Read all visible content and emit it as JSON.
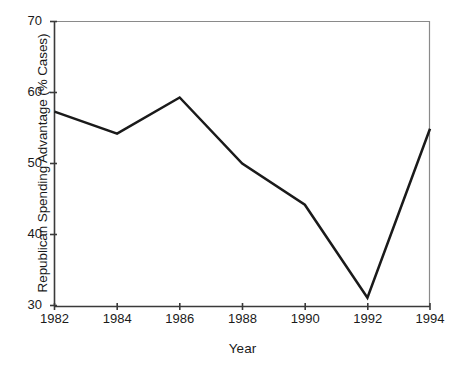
{
  "chart_data": {
    "type": "line",
    "title": "",
    "xlabel": "Year",
    "ylabel": "Republican Spending Advantage (% Cases)",
    "x": [
      1982,
      1984,
      1986,
      1988,
      1990,
      1992,
      1994
    ],
    "categories": [
      "1982",
      "1984",
      "1986",
      "1988",
      "1990",
      "1992",
      "1994"
    ],
    "values": [
      57.3,
      54.2,
      59.3,
      50.0,
      44.2,
      31.1,
      54.9
    ],
    "series": [
      {
        "name": "Republican Spending Advantage",
        "values": [
          57.3,
          54.2,
          59.3,
          50.0,
          44.2,
          31.1,
          54.9
        ]
      }
    ],
    "xlim": [
      1982,
      1994
    ],
    "ylim": [
      30,
      70
    ],
    "xticks": [
      "1982",
      "1984",
      "1986",
      "1988",
      "1990",
      "1992",
      "1994"
    ],
    "yticks": [
      "30",
      "40",
      "50",
      "60",
      "70"
    ],
    "grid": false,
    "legend": "none",
    "line_color": "#1a1a1a",
    "line_width": 2.5,
    "markers": "none",
    "background_color": "#ffffff",
    "axis_color": "#3a3a3a"
  },
  "axes": {
    "y_title": "Republican Spending Advantage (% Cases)",
    "x_title": "Year",
    "y_ticks": [
      {
        "label": "70",
        "value": 70
      },
      {
        "label": "60",
        "value": 60
      },
      {
        "label": "50",
        "value": 50
      },
      {
        "label": "40",
        "value": 40
      },
      {
        "label": "30",
        "value": 30
      }
    ],
    "x_ticks": [
      {
        "label": "1982",
        "value": 1982
      },
      {
        "label": "1984",
        "value": 1984
      },
      {
        "label": "1986",
        "value": 1986
      },
      {
        "label": "1988",
        "value": 1988
      },
      {
        "label": "1990",
        "value": 1990
      },
      {
        "label": "1992",
        "value": 1992
      },
      {
        "label": "1994",
        "value": 1994
      }
    ]
  }
}
